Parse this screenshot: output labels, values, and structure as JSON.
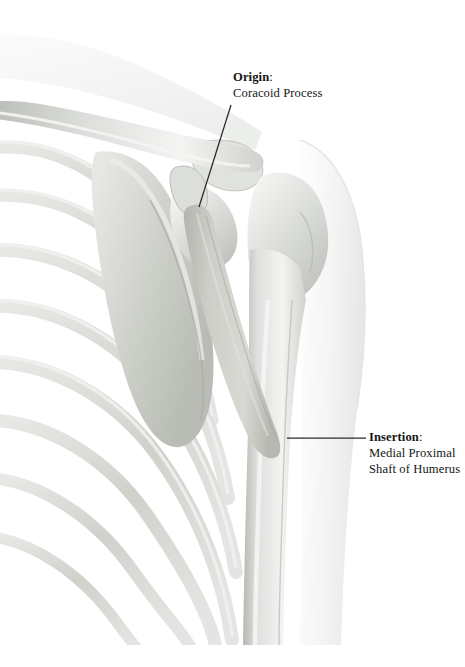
{
  "figure": {
    "background_color": "#ffffff",
    "bone_color": "#d5d7d2",
    "bone_light": "#f2f3f1",
    "bone_shadow": "#b4b7b0",
    "muscle_color": "#c9cac4",
    "muscle_shadow": "#adaea7",
    "soft_tissue_color": "#f4f5f4",
    "leader_line_color": "#2a2a2a"
  },
  "labels": {
    "origin": {
      "term": "Origin",
      "colon": ":",
      "detail": "Coracoid Process",
      "leader": {
        "x1": 231,
        "y1": 105,
        "x2": 199,
        "y2": 207
      }
    },
    "insertion": {
      "term": "Insertion",
      "colon": ":",
      "detail_line1": "Medial Proximal",
      "detail_line2": "Shaft of Humerus",
      "leader": {
        "x1": 366,
        "y1": 438,
        "x2": 287,
        "y2": 438
      }
    }
  },
  "structures": [
    {
      "name": "clavicle",
      "label": "Clavicle"
    },
    {
      "name": "scapula",
      "label": "Scapula"
    },
    {
      "name": "acromion",
      "label": "Acromion"
    },
    {
      "name": "coracoid-process",
      "label": "Coracoid Process"
    },
    {
      "name": "humerus",
      "label": "Humerus"
    },
    {
      "name": "humeral-head",
      "label": "Head of Humerus"
    },
    {
      "name": "rib-cage",
      "label": "Rib Cage"
    },
    {
      "name": "coracobrachialis-muscle",
      "label": "Coracobrachialis"
    },
    {
      "name": "deltoid-soft-tissue",
      "label": "Deltoid Silhouette"
    }
  ]
}
